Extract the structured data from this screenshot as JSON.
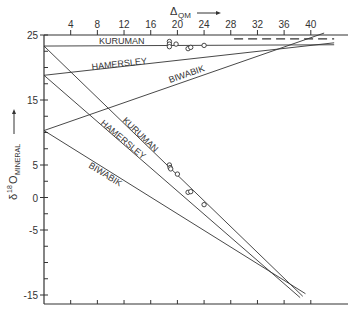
{
  "chart_data": {
    "type": "line",
    "title": "",
    "xlabel": "Δ QM",
    "xlabel_main": "Δ",
    "xlabel_sub": "QM",
    "xlabel_arrow": "→",
    "ylabel_main": "δ",
    "ylabel_sup": "18",
    "ylabel_O": "O",
    "ylabel_sub": "MINERAL",
    "ylabel_arrow": "→",
    "x_axis_position": "top",
    "xlim": [
      0,
      45
    ],
    "ylim": [
      -17,
      25
    ],
    "x_ticks": [
      4,
      8,
      12,
      16,
      20,
      24,
      28,
      32,
      36,
      40
    ],
    "y_tick_labels": [
      25,
      15,
      5,
      0,
      -5,
      -15
    ],
    "grid": false,
    "legend": "none (inline line labels)",
    "series": [
      {
        "name": "KURUMAN (quartz)",
        "label": "KURUMAN",
        "points": [
          [
            0,
            23.3
          ],
          [
            43.5,
            23.5
          ]
        ]
      },
      {
        "name": "HAMERSLEY (quartz)",
        "label": "HAMERSLEY",
        "points": [
          [
            0,
            18.8
          ],
          [
            43.5,
            23.8
          ]
        ]
      },
      {
        "name": "BIWABIK (quartz)",
        "label": "BIWABIK",
        "points": [
          [
            0,
            10.3
          ],
          [
            42,
            25.3
          ]
        ]
      },
      {
        "name": "KURUMAN (magnetite)",
        "label": "KURUMAN",
        "points": [
          [
            0,
            23.3
          ],
          [
            38.8,
            -15.2
          ]
        ]
      },
      {
        "name": "HAMERSLEY (magnetite)",
        "label": "HAMERSLEY",
        "points": [
          [
            0,
            18.8
          ],
          [
            38.4,
            -15.4
          ]
        ]
      },
      {
        "name": "BIWABIK (magnetite)",
        "label": "BIWABIK",
        "points": [
          [
            0,
            10.3
          ],
          [
            39.2,
            -14.8
          ]
        ]
      },
      {
        "name": "dashed reference",
        "label": "",
        "style": "dashed",
        "points": [
          [
            28.5,
            24.4
          ],
          [
            43.5,
            24.4
          ]
        ]
      }
    ],
    "data_points": {
      "quartz": [
        [
          18.8,
          24.0
        ],
        [
          18.8,
          23.6
        ],
        [
          18.8,
          23.2
        ],
        [
          19.8,
          23.6
        ],
        [
          21.6,
          22.9
        ],
        [
          22.0,
          23.1
        ],
        [
          24.0,
          23.4
        ]
      ],
      "magnetite": [
        [
          18.8,
          5.0
        ],
        [
          18.9,
          4.6
        ],
        [
          19.0,
          4.4
        ],
        [
          20.0,
          3.6
        ],
        [
          21.6,
          0.8
        ],
        [
          22.0,
          0.9
        ],
        [
          24.0,
          -1.1
        ]
      ]
    }
  }
}
